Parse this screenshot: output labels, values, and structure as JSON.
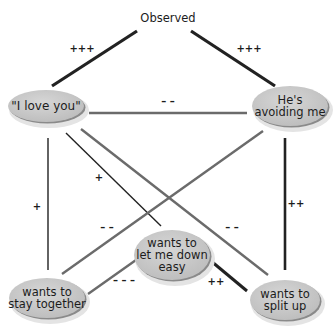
{
  "diagram": {
    "title": {
      "label": "Observed",
      "x": 168,
      "y": 22
    },
    "colors": {
      "node_fill": "#c8c8c8",
      "node_highlight": "#d9d9d9",
      "node_shadow": "#e4e4e4",
      "node_rim": "#8a8a8a",
      "edge_dark": "#222222",
      "edge_mid": "#6b6b6b",
      "text": "#1c1c1c"
    },
    "nodes": [
      {
        "id": "love",
        "lines": [
          "\"I love you\""
        ],
        "cx": 46,
        "cy": 106,
        "rx": 38,
        "ry": 16,
        "font": 12
      },
      {
        "id": "avoiding",
        "lines": [
          "He's",
          "avoiding me"
        ],
        "cx": 290,
        "cy": 106,
        "rx": 38,
        "ry": 20,
        "font": 11.5
      },
      {
        "id": "letdown",
        "lines": [
          "wants to",
          "let me down",
          "easy"
        ],
        "cx": 172,
        "cy": 255,
        "rx": 38,
        "ry": 25,
        "font": 11.5
      },
      {
        "id": "stay",
        "lines": [
          "wants to",
          "stay together"
        ],
        "cx": 47,
        "cy": 298,
        "rx": 38,
        "ry": 20,
        "font": 11.5
      },
      {
        "id": "split",
        "lines": [
          "wants to",
          "split up"
        ],
        "cx": 285,
        "cy": 300,
        "rx": 35,
        "ry": 20,
        "font": 11.5
      }
    ],
    "edges": [
      {
        "from": "observed",
        "to": "love",
        "x1": 137,
        "y1": 31,
        "x2": 52,
        "y2": 86,
        "width": 3.2,
        "color": "dark",
        "label": "+++",
        "lx": 82,
        "ly": 52
      },
      {
        "from": "observed",
        "to": "avoiding",
        "x1": 191,
        "y1": 31,
        "x2": 275,
        "y2": 86,
        "width": 3.2,
        "color": "dark",
        "label": "+++",
        "lx": 249,
        "ly": 52
      },
      {
        "from": "love",
        "to": "avoiding",
        "x1": 89,
        "y1": 113,
        "x2": 247,
        "y2": 113,
        "width": 2.6,
        "color": "mid",
        "label": "– –",
        "lx": 168,
        "ly": 105
      },
      {
        "from": "love",
        "to": "stay",
        "x1": 48,
        "y1": 138,
        "x2": 48,
        "y2": 270,
        "width": 1.4,
        "color": "dark",
        "label": "+",
        "lx": 37,
        "ly": 210
      },
      {
        "from": "love",
        "to": "letdown",
        "x1": 66,
        "y1": 133,
        "x2": 161,
        "y2": 226,
        "width": 1.4,
        "color": "dark",
        "label": "+",
        "lx": 99,
        "ly": 181
      },
      {
        "from": "love",
        "to": "split",
        "x1": 81,
        "y1": 129,
        "x2": 268,
        "y2": 275,
        "width": 2.4,
        "color": "mid",
        "label": "– –",
        "lx": 232,
        "ly": 231
      },
      {
        "from": "avoiding",
        "to": "stay",
        "x1": 263,
        "y1": 131,
        "x2": 62,
        "y2": 274,
        "width": 2.4,
        "color": "mid",
        "label": "– –",
        "lx": 107,
        "ly": 231
      },
      {
        "from": "avoiding",
        "to": "split",
        "x1": 285,
        "y1": 138,
        "x2": 285,
        "y2": 270,
        "width": 2.6,
        "color": "dark",
        "label": "++",
        "lx": 296,
        "ly": 207
      },
      {
        "from": "letdown",
        "to": "stay",
        "x1": 136,
        "y1": 260,
        "x2": 88,
        "y2": 294,
        "width": 2.4,
        "color": "mid",
        "label": "– – –",
        "lx": 124,
        "ly": 284
      },
      {
        "from": "letdown",
        "to": "split",
        "x1": 211,
        "y1": 261,
        "x2": 247,
        "y2": 291,
        "width": 3.0,
        "color": "dark",
        "label": "++",
        "lx": 216,
        "ly": 285
      }
    ]
  }
}
